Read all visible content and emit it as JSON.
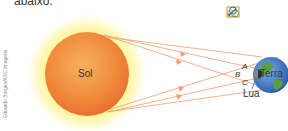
{
  "intro_text": "abaixo.",
  "credit": "Eduardo Borges/ASC Imagens",
  "labels": {
    "sun": "Sol",
    "earth": "Terra",
    "moon": "Lua",
    "point_a": "A",
    "point_b": "B",
    "point_c": "C"
  },
  "icons": [
    "diagram-link-icon",
    "venn-icon"
  ],
  "colors": {
    "sun_core": "#f08a3c",
    "sun_glow": "#fff27a",
    "ray": "#f0a070",
    "earth_ocean": "#3c7ac8",
    "earth_land": "#5aa040",
    "moon": "#3a3a3a"
  }
}
